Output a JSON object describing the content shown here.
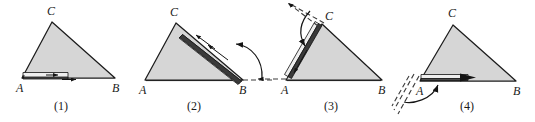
{
  "figure": {
    "colors": {
      "triangle_fill": "#d6d6d6",
      "triangle_stroke": "#1c1c1c",
      "bar_fill": "#3a3a3a",
      "bar_highlight": "#e8e8e8",
      "dashed_line": "#3a3a3a",
      "text": "#1a1a1a",
      "background": "#ffffff"
    },
    "vertex_labels": {
      "a": "A",
      "b": "B",
      "c": "C"
    },
    "panels": [
      {
        "caption": "(1)",
        "caption_x": 60,
        "caption_y": 108,
        "vertices": {
          "A": [
            22,
            78
          ],
          "B": [
            115,
            78
          ],
          "C": [
            52,
            22
          ]
        },
        "label_pos": {
          "A": [
            16,
            92
          ],
          "B": [
            114,
            92
          ],
          "C": [
            47,
            14
          ]
        },
        "bar_edge": "AB",
        "bar_note": "straightedge lying along side AB with arrow pointing right toward B"
      },
      {
        "caption": "(2)",
        "caption_x": 193,
        "caption_y": 108,
        "vertices": {
          "A": [
            145,
            80
          ],
          "B": [
            243,
            80
          ],
          "C": [
            176,
            23
          ]
        },
        "label_pos": {
          "A": [
            139,
            94
          ],
          "B": [
            241,
            94
          ],
          "C": [
            171,
            15
          ]
        },
        "bar_edge": "BC",
        "bar_note": "straightedge rotated about B onto side BC, arrows point up-left toward C",
        "dashed_note": "horizontal dashed ray extending right from B",
        "arc_note": "curved arrow from dashed ray rotating counterclockwise onto BC"
      },
      {
        "caption": "(3)",
        "caption_x": 330,
        "caption_y": 108,
        "vertices": {
          "A": [
            286,
            80
          ],
          "B": [
            382,
            80
          ],
          "C": [
            322,
            24
          ]
        },
        "label_pos": {
          "A": [
            280,
            94
          ],
          "B": [
            380,
            94
          ],
          "C": [
            325,
            17
          ]
        },
        "bar_edge": "CA",
        "bar_note": "straightedge rotated about C onto side CA, arrow points down-left toward A",
        "dashed_note": "dashed ray through C continuing the direction of BC up-left, plus short dashed ray left of A",
        "arc_note": "curved arrow from dashed ray rotating onto CA"
      },
      {
        "caption": "(4)",
        "caption_x": 466,
        "caption_y": 108,
        "vertices": {
          "A": [
            420,
            81
          ],
          "B": [
            516,
            81
          ],
          "C": [
            453,
            25
          ]
        },
        "label_pos": {
          "A": [
            417,
            95
          ],
          "B": [
            514,
            95
          ],
          "C": [
            448,
            16
          ]
        },
        "bar_edge": "AB",
        "bar_note": "straightedge rotated about A back onto side AB, arrow points right toward B",
        "dashed_note": "dashed rays down-left from A continuing the direction of CA",
        "arc_note": "curved arrow from dashed ray rotating onto AB"
      }
    ]
  }
}
